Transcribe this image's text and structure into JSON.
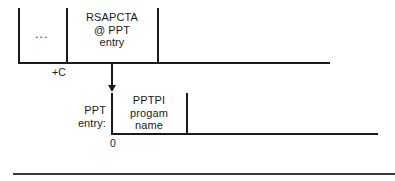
{
  "figure": {
    "colors": {
      "ink": "#1a1a1a",
      "background": "#ffffff",
      "rule": "#3a3a3a"
    },
    "top_row": {
      "name": "upper-table-row",
      "cells": [
        {
          "id": "ellipsis-cell",
          "text": "..."
        },
        {
          "id": "rsapcta-cell",
          "text": "RSAPCTA\n@ PPT\nentry"
        }
      ],
      "offset_label": "+C"
    },
    "arrow": {
      "name": "pointer-arrow",
      "direction": "down"
    },
    "bottom_row": {
      "name": "ppt-entry-row",
      "side_label": "PPT\nentry:",
      "cells": [
        {
          "id": "pptpi-cell",
          "text": "PPTPI\nprogam\nname"
        }
      ],
      "offset_label": "0"
    }
  }
}
